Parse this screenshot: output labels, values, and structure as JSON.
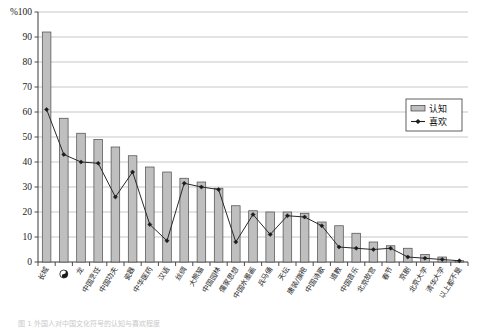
{
  "chart_data": {
    "type": "bar",
    "title": "",
    "subtitle": "",
    "xlabel": "",
    "ylabel": "",
    "unit_label": "%",
    "ylim": [
      0,
      100
    ],
    "ytick_step": 10,
    "yticks": [
      0,
      10,
      20,
      30,
      40,
      50,
      60,
      70,
      80,
      90,
      100
    ],
    "ytick_labels": [
      "0",
      "10",
      "20",
      "30",
      "40",
      "50",
      "60",
      "70",
      "80",
      "90",
      "100"
    ],
    "grid": true,
    "grid_axis": "y",
    "legend_position": "right-upper-inside",
    "categories": [
      "长城",
      "☯",
      "龙",
      "中国烹饪",
      "中国功夫",
      "瓷器",
      "中华医药",
      "汉语",
      "丝绸",
      "大熊猫",
      "中国园林",
      "儒家思想",
      "中国水墨画",
      "兵马俑",
      "天坛",
      "唐装/旗袍",
      "中国诗歌",
      "道教",
      "中国音乐",
      "北京故宫",
      "春节",
      "京剧",
      "北京大学",
      "清华大学",
      "以上都不是"
    ],
    "series": [
      {
        "name": "认知",
        "type": "bar",
        "values": [
          92,
          57.5,
          51.5,
          49,
          46,
          42.5,
          38,
          36,
          33.5,
          32,
          29.5,
          22.5,
          20.5,
          20,
          20,
          19.5,
          16,
          14.5,
          11.5,
          8,
          6.5,
          5.5,
          3,
          2,
          0.5
        ]
      },
      {
        "name": "喜欢",
        "type": "line",
        "values": [
          61,
          43,
          40,
          39.5,
          26,
          36,
          15,
          8.5,
          31.5,
          30,
          29,
          8,
          19,
          11,
          18.5,
          18,
          14.5,
          6,
          5.5,
          5,
          5.5,
          2,
          1.5,
          1,
          0.5
        ]
      }
    ]
  },
  "legend": {
    "items": [
      {
        "label": "认知",
        "marker": "bar-swatch"
      },
      {
        "label": "喜欢",
        "marker": "line-diamond"
      }
    ]
  },
  "caption": {
    "text": "图 1    外国人对中国文化符号的认知与喜欢程度"
  }
}
